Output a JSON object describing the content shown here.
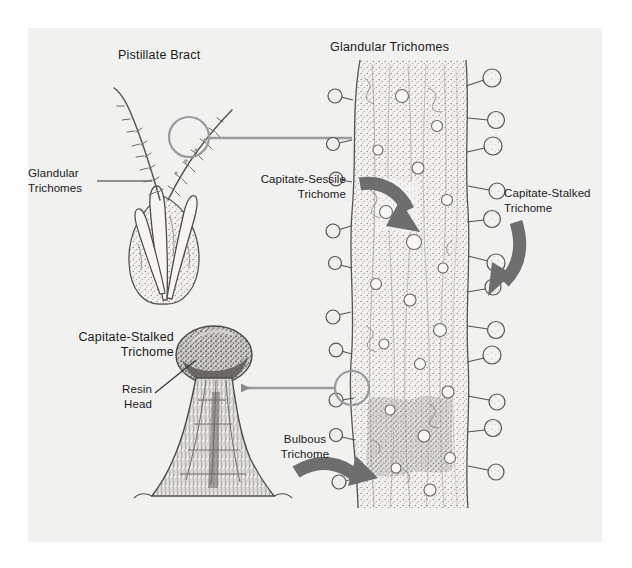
{
  "figure": {
    "kind": "botanical-illustration",
    "subject": "Glandular Trichomes",
    "background_color": "#ffffff",
    "panel_color": "#f1f1f0",
    "ink_color": "#4a4a4a",
    "accent_color": "#8a8a8a",
    "arrow_color": "#6e6e6e",
    "text_color": "#1a1a1a"
  },
  "headings": {
    "pistillate_bract": "Pistillate Bract",
    "glandular_trichomes": "Glandular Trichomes",
    "capitate_stalked_panel": "Capitate-Stalked\nTrichome"
  },
  "labels": {
    "glandular_trichomes_callout": "Glandular\nTrichomes",
    "capitate_sessile": "Capitate-Sessile\nTrichome",
    "capitate_stalked": "Capitate-Stalked\nTrichome",
    "bulbous": "Bulbous\nTrichome",
    "resin_head": "Resin\nHead"
  },
  "connectors": [
    {
      "name": "bract-to-column",
      "from": "pistillate-bract-magnifier",
      "to": "trichome-column",
      "style": "line",
      "circle_at": "start"
    },
    {
      "name": "column-to-detail",
      "from": "trichome-column-magnifier",
      "to": "capitate-stalked-detail",
      "style": "arrow-left",
      "circle_at": "start"
    }
  ],
  "pointer_arrows": [
    {
      "name": "capitate-sessile-arrow",
      "direction": "curve-right-down"
    },
    {
      "name": "capitate-stalked-arrow",
      "direction": "curve-down-left"
    },
    {
      "name": "bulbous-arrow",
      "direction": "curve-right-up"
    }
  ]
}
